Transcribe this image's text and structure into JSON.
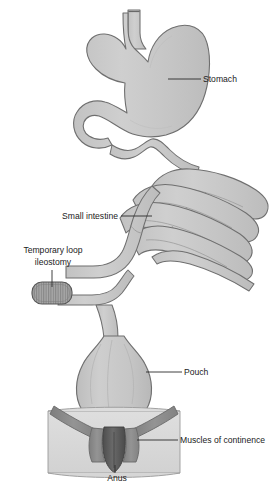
{
  "figure": {
    "background_color": "#ffffff",
    "organ_fill": "#c9c9c9",
    "organ_stroke": "#6f6f6f",
    "muscle_fill": "#8f8f8f",
    "muscle_dark_fill": "#595959",
    "pelvis_fill": "#d9d9d9",
    "stoma_fill": "#a0a0a0",
    "leader_color": "#2b2b2b",
    "text_color": "#1b1b1b"
  },
  "labels": {
    "stomach": {
      "text": "Stomach",
      "x": 203,
      "y": 82,
      "anchor": "start"
    },
    "small_intestine": {
      "text": "Small intestine",
      "x": 118,
      "y": 219,
      "anchor": "end"
    },
    "temporary_loop_ileostomy": {
      "line1": "Temporary loop",
      "line2": "ileostomy",
      "x": 53,
      "y1": 253,
      "y2": 265,
      "anchor": "middle"
    },
    "pouch": {
      "text": "Pouch",
      "x": 184,
      "y": 375,
      "anchor": "start"
    },
    "muscles_of_continence": {
      "text": "Muscles of continence",
      "x": 180,
      "y": 443,
      "anchor": "start"
    },
    "anus": {
      "text": "Anus",
      "x": 117,
      "y": 481,
      "anchor": "middle"
    }
  },
  "structures": [
    {
      "id": "stomach",
      "name": "Stomach"
    },
    {
      "id": "small-intestine",
      "name": "Small intestine"
    },
    {
      "id": "temporary-loop-ileostomy",
      "name": "Temporary loop ileostomy"
    },
    {
      "id": "pouch",
      "name": "Pouch"
    },
    {
      "id": "muscles-of-continence",
      "name": "Muscles of continence"
    },
    {
      "id": "anus",
      "name": "Anus"
    },
    {
      "id": "pelvic-floor",
      "name": "Pelvic floor"
    },
    {
      "id": "esophagus",
      "name": "Esophagus"
    },
    {
      "id": "duodenum",
      "name": "Duodenum"
    }
  ]
}
